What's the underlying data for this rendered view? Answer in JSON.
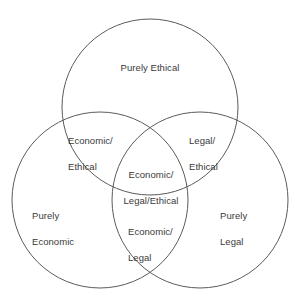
{
  "diagram": {
    "type": "venn",
    "set_count": 3,
    "stroke_color": "#5b5b5b",
    "text_color": "#3a3a3a",
    "background_color": "#ffffff",
    "sets": [
      {
        "id": "ethical",
        "name": "Ethical",
        "position": "top"
      },
      {
        "id": "economic",
        "name": "Economic",
        "position": "bottom-left"
      },
      {
        "id": "legal",
        "name": "Legal",
        "position": "bottom-right"
      }
    ],
    "regions": {
      "ethical_only": "Purely Ethical",
      "economic_only_line1": "Purely",
      "economic_only_line2": "Economic",
      "legal_only_line1": "Purely",
      "legal_only_line2": "Legal",
      "economic_ethical_line1": "Economic/",
      "economic_ethical_line2": "Ethical",
      "legal_ethical_line1": "Legal/",
      "legal_ethical_line2": "Ethical",
      "economic_legal_line1": "Economic/",
      "economic_legal_line2": "Legal",
      "all_three_line1": "Economic/",
      "all_three_line2": "Legal/Ethical"
    }
  }
}
